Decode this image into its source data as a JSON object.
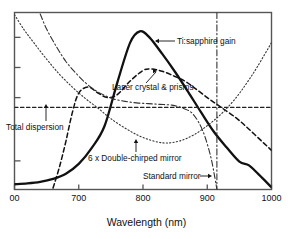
{
  "figure": {
    "axis_title": "Wavelength (nm)",
    "frame_color": "#555555",
    "curve_color": "#111111"
  },
  "annotations": {
    "gain": "Ti:sapphire gain",
    "crystal_prisms": "Laser crystal & prisms",
    "total_dispersion": "Total dispersion",
    "dcm": "6 x Double-chirped mirror",
    "standard_mirror": "Standard mirror"
  },
  "xticks": [
    {
      "value": 600,
      "label": "00"
    },
    {
      "value": 700,
      "label": "700"
    },
    {
      "value": 800,
      "label": "800"
    },
    {
      "value": 900,
      "label": "900"
    },
    {
      "value": 1000,
      "label": "1000"
    }
  ],
  "chart_data": {
    "type": "line",
    "title": "",
    "xlabel": "Wavelength (nm)",
    "ylabel": "",
    "xlim": [
      600,
      1000
    ],
    "ylim": [
      -1.0,
      1.35
    ],
    "grid": false,
    "legend_position": "inline-annotations",
    "xticks": [
      600,
      700,
      800,
      900,
      1000
    ],
    "yticks_unlabeled": 4,
    "series": [
      {
        "name": "Ti:sapphire gain",
        "style": "solid-thick",
        "x": [
          600,
          620,
          640,
          660,
          680,
          700,
          720,
          740,
          760,
          780,
          795,
          810,
          830,
          850,
          870,
          890,
          910,
          930,
          950,
          965,
          980,
          1000
        ],
        "y": [
          -0.93,
          -0.92,
          -0.9,
          -0.86,
          -0.79,
          -0.66,
          -0.45,
          -0.16,
          0.42,
          0.95,
          1.1,
          1.02,
          0.8,
          0.56,
          0.3,
          0.03,
          -0.23,
          -0.44,
          -0.63,
          -0.68,
          -0.8,
          -0.97
        ]
      },
      {
        "name": "Laser crystal & prisms",
        "style": "dashed",
        "x": [
          660,
          670,
          680,
          690,
          700,
          715,
          730,
          745,
          760,
          780,
          800,
          812,
          830,
          850,
          865,
          880,
          900,
          920,
          945,
          965,
          985,
          1000
        ],
        "y": [
          -0.98,
          -0.7,
          -0.36,
          0.02,
          0.28,
          0.36,
          0.28,
          0.22,
          0.26,
          0.44,
          0.58,
          0.6,
          0.57,
          0.5,
          0.44,
          0.35,
          0.22,
          0.1,
          -0.05,
          -0.2,
          -0.36,
          -0.48
        ]
      },
      {
        "name": "Total dispersion",
        "style": "dashed-horizontal",
        "x": [
          600,
          1000
        ],
        "y": [
          0.09,
          0.09
        ]
      },
      {
        "name": "6 x Double-chirped mirror",
        "style": "dotted",
        "x": [
          600,
          615,
          630,
          650,
          670,
          690,
          710,
          730,
          750,
          775,
          800,
          830,
          855,
          880,
          905,
          925,
          945,
          962,
          978,
          1000
        ],
        "y": [
          1.32,
          1.12,
          0.95,
          0.73,
          0.53,
          0.36,
          0.21,
          0.08,
          -0.06,
          -0.2,
          -0.31,
          -0.38,
          -0.36,
          -0.27,
          -0.12,
          0.03,
          0.22,
          0.42,
          0.63,
          0.95
        ]
      },
      {
        "name": "Standard mirror",
        "style": "dash-dot",
        "branch_left": {
          "x": [
            640,
            650,
            665,
            680,
            695,
            710,
            725,
            740,
            755,
            772,
            790,
            808,
            826,
            845,
            862,
            878,
            893,
            905,
            912,
            915
          ],
          "y": [
            1.33,
            1.13,
            0.9,
            0.7,
            0.55,
            0.42,
            0.32,
            0.25,
            0.2,
            0.17,
            0.15,
            0.14,
            0.13,
            0.12,
            0.08,
            0.0,
            -0.22,
            -0.55,
            -0.85,
            -1.0
          ]
        },
        "asymptote_x": 915
      }
    ]
  }
}
